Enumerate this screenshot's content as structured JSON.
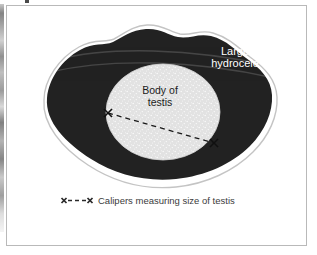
{
  "figure": {
    "type": "medical-illustration",
    "background_color": "#ffffff",
    "frame_border_color": "#b9b9b9"
  },
  "labels": {
    "hydrocele": "Large\nhydrocele",
    "hydrocele_color": "#ffffff",
    "testis": "Body of\ntestis",
    "testis_color": "#1c1c1c"
  },
  "caption": {
    "symbol": "x---x",
    "text": "Calipers measuring size of testis",
    "color": "#3b3b3b"
  },
  "shapes": {
    "hydrocele_fill": "#222222",
    "testis_fill": "#e2e2e2",
    "testis_stipple": "#ffffff",
    "outline_color": "#c4c4c4",
    "caliper_line_color": "#1a1a1a"
  }
}
